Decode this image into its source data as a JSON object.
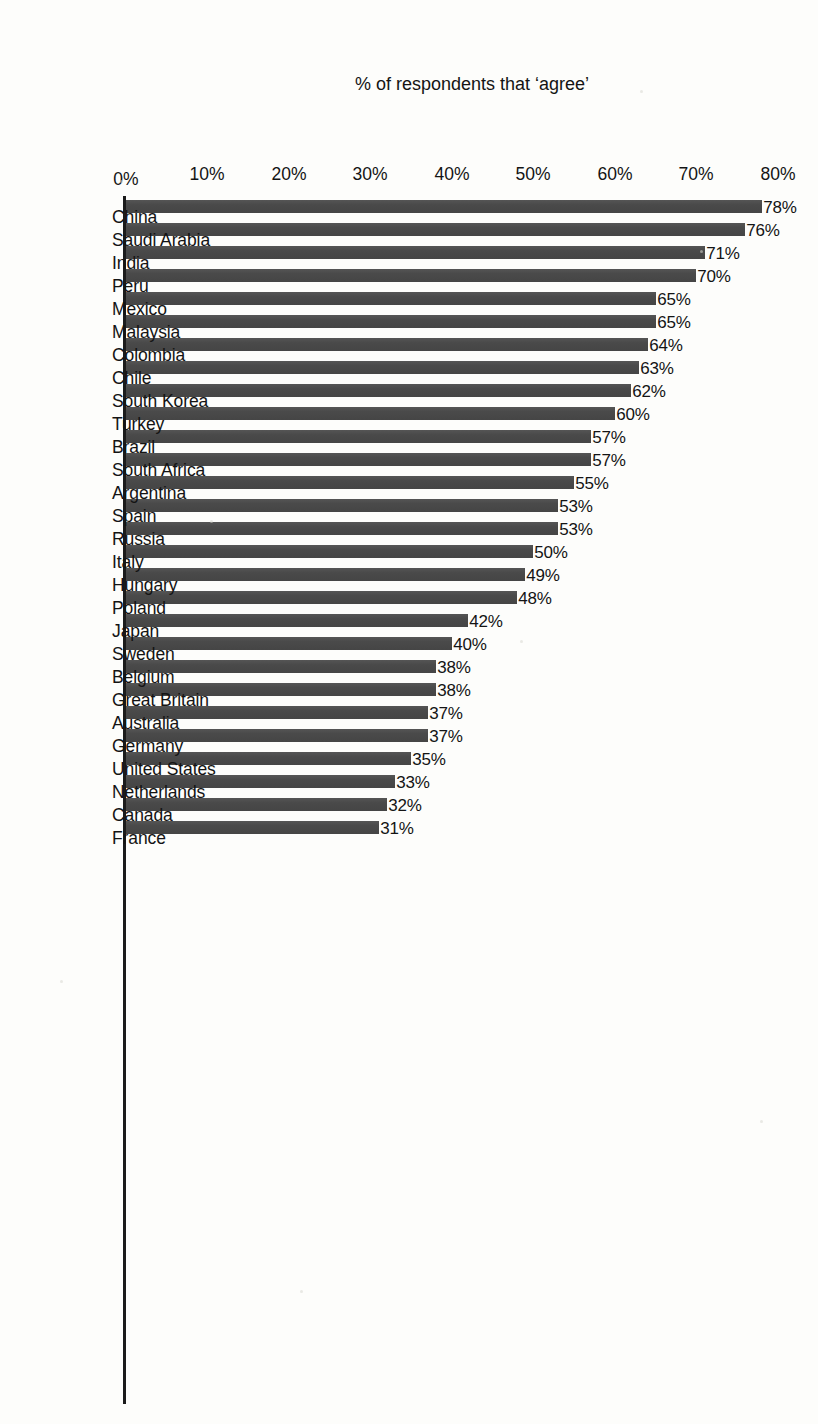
{
  "chart_data": {
    "type": "bar",
    "title": "",
    "subtitle": "",
    "orientation": "vertical-bars-on-rotated-page",
    "xlabel": "",
    "ylabel": "% of respondents that ‘agree’",
    "ylim": [
      0,
      80
    ],
    "ytick_step": 10,
    "grid": false,
    "legend": null,
    "value_suffix": "%",
    "bar_color": "#4a4a4a",
    "background_color": "#fdfdfb",
    "categories": [
      "China",
      "Saudi Arabia",
      "India",
      "Peru",
      "Mexico",
      "Malaysia",
      "Colombia",
      "Chile",
      "South Korea",
      "Turkey",
      "Brazil",
      "South Africa",
      "Argentina",
      "Spain",
      "Russia",
      "Italy",
      "Hungary",
      "Poland",
      "Japan",
      "Sweden",
      "Belgium",
      "Great Britain",
      "Australia",
      "Germany",
      "United States",
      "Netherlands",
      "Canada",
      "France"
    ],
    "values": [
      78,
      76,
      71,
      70,
      65,
      65,
      64,
      63,
      62,
      60,
      57,
      57,
      55,
      53,
      53,
      50,
      49,
      48,
      42,
      40,
      38,
      38,
      37,
      37,
      35,
      33,
      32,
      31
    ],
    "value_labels": [
      "78%",
      "76%",
      "71%",
      "70%",
      "65%",
      "65%",
      "64%",
      "63%",
      "62%",
      "60%",
      "57%",
      "57%",
      "55%",
      "53%",
      "53%",
      "50%",
      "49%",
      "48%",
      "42%",
      "40%",
      "38%",
      "38%",
      "37%",
      "37%",
      "35%",
      "33%",
      "32%",
      "31%"
    ],
    "ytick_labels": [
      "0%",
      "10%",
      "20%",
      "30%",
      "40%",
      "50%",
      "60%",
      "70%",
      "80%"
    ],
    "yticks": [
      0,
      10,
      20,
      30,
      40,
      50,
      60,
      70,
      80
    ],
    "groups": [
      {
        "label": "Developing",
        "start_index": 0,
        "end_index": 10
      },
      {
        "label": "Developed",
        "start_index": 18,
        "end_index": 27
      }
    ]
  }
}
